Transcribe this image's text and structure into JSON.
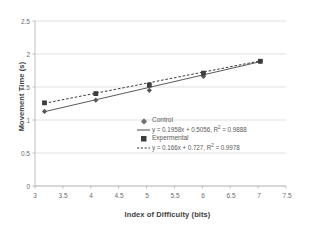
{
  "chart_data": {
    "type": "scatter",
    "title": "",
    "xlabel": "Index of Difficulty (bits)",
    "ylabel": "Movement Time (s)",
    "xlim": [
      3,
      7.5
    ],
    "ylim": [
      0,
      2.5
    ],
    "xticks": [
      "3",
      "3.5",
      "4",
      "4.5",
      "5",
      "5.5",
      "6",
      "6.5",
      "7",
      "7.5"
    ],
    "yticks": [
      "0",
      "0.5",
      "1",
      "1.5",
      "2",
      "2.5"
    ],
    "grid": "horizontal",
    "legend_position": "inside-center",
    "series": [
      {
        "name": "Control",
        "marker": "diamond",
        "line_style": "solid",
        "color": "#595959",
        "x": [
          3.17,
          4.09,
          5.05,
          6.02,
          7.04
        ],
        "values": [
          1.13,
          1.3,
          1.45,
          1.66,
          1.885
        ],
        "fit_equation": "y = 0.1958x + 0.5056,  R",
        "fit_r2_exp": "2",
        "fit_r2_value": " = 0.9888",
        "slope": 0.1958,
        "intercept": 0.5056,
        "r_squared": 0.9888
      },
      {
        "name": "Expermental",
        "marker": "square",
        "line_style": "dashed",
        "color": "#3d3d3d",
        "x": [
          3.17,
          4.09,
          5.05,
          6.02,
          7.04
        ],
        "values": [
          1.26,
          1.4,
          1.53,
          1.71,
          1.89
        ],
        "fit_equation": "y = 0.166x + 0.727,  R",
        "fit_r2_exp": "2",
        "fit_r2_value": " = 0.9978",
        "slope": 0.166,
        "intercept": 0.727,
        "r_squared": 0.9978
      }
    ]
  },
  "legend": {
    "entries": [
      {
        "label": "Control",
        "marker": "diamond-marker"
      },
      {
        "label": "y = 0.1958x + 0.5056,  R",
        "exp": "2",
        "tail": " = 0.9888",
        "marker": "solid-line-swatch"
      },
      {
        "label": "Expermental",
        "marker": "square-marker"
      },
      {
        "label": "y = 0.166x + 0.727,  R",
        "exp": "2",
        "tail": " = 0.9978",
        "marker": "dashed-line-swatch"
      }
    ]
  },
  "axes": {
    "y_title": "Movement Time (s)",
    "x_title": "Index of Difficulty (bits)",
    "y_labels": [
      "2.5",
      "2",
      "1.5",
      "1",
      "0.5",
      "0"
    ],
    "x_labels": [
      "3",
      "3.5",
      "4",
      "4.5",
      "5",
      "5.5",
      "6",
      "6.5",
      "7",
      "7.5"
    ]
  },
  "colors": {
    "grid": "#d9d9d9",
    "axis": "#b5b5b5",
    "control": "#595959",
    "experimental": "#3d3d3d",
    "text": "#5a5a5a"
  }
}
